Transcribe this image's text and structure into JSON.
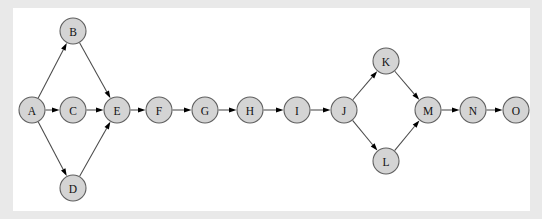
{
  "canvas": {
    "background_color": "#e9e9e9",
    "panel_color": "#ffffff",
    "width": 542,
    "height": 219,
    "panel": {
      "x": 13,
      "y": 8,
      "width": 517,
      "height": 203
    }
  },
  "style": {
    "node_fill": "#d4d4d4",
    "node_stroke": "#5f5f5f",
    "edge_color": "#4a4a4a",
    "arrowhead_color": "#000000",
    "label_color": "#111111",
    "node_radius": 13
  },
  "graph": {
    "type": "directed-graph",
    "nodes": [
      {
        "id": "A",
        "label": "A",
        "x": 32,
        "y": 110
      },
      {
        "id": "B",
        "label": "B",
        "x": 73,
        "y": 31
      },
      {
        "id": "C",
        "label": "C",
        "x": 73,
        "y": 110
      },
      {
        "id": "D",
        "label": "D",
        "x": 73,
        "y": 188
      },
      {
        "id": "E",
        "label": "E",
        "x": 117,
        "y": 110
      },
      {
        "id": "F",
        "label": "F",
        "x": 159,
        "y": 110
      },
      {
        "id": "G",
        "label": "G",
        "x": 205,
        "y": 110
      },
      {
        "id": "H",
        "label": "H",
        "x": 250,
        "y": 110
      },
      {
        "id": "I",
        "label": "I",
        "x": 297,
        "y": 110
      },
      {
        "id": "J",
        "label": "J",
        "x": 344,
        "y": 110
      },
      {
        "id": "K",
        "label": "K",
        "x": 386,
        "y": 61
      },
      {
        "id": "L",
        "label": "L",
        "x": 386,
        "y": 161
      },
      {
        "id": "M",
        "label": "M",
        "x": 428,
        "y": 110
      },
      {
        "id": "N",
        "label": "N",
        "x": 473,
        "y": 110
      },
      {
        "id": "O",
        "label": "O",
        "x": 516,
        "y": 110
      }
    ],
    "edges": [
      {
        "from": "A",
        "to": "B"
      },
      {
        "from": "A",
        "to": "C"
      },
      {
        "from": "A",
        "to": "D"
      },
      {
        "from": "B",
        "to": "E"
      },
      {
        "from": "C",
        "to": "E"
      },
      {
        "from": "D",
        "to": "E"
      },
      {
        "from": "E",
        "to": "F"
      },
      {
        "from": "F",
        "to": "G"
      },
      {
        "from": "G",
        "to": "H"
      },
      {
        "from": "H",
        "to": "I"
      },
      {
        "from": "I",
        "to": "J"
      },
      {
        "from": "J",
        "to": "K"
      },
      {
        "from": "J",
        "to": "L"
      },
      {
        "from": "K",
        "to": "M"
      },
      {
        "from": "L",
        "to": "M"
      },
      {
        "from": "M",
        "to": "N"
      },
      {
        "from": "N",
        "to": "O"
      }
    ]
  }
}
